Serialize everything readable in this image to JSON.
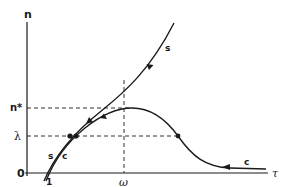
{
  "diagram": {
    "title": "",
    "axes": {
      "y_label": "n",
      "x_label": "τ",
      "origin_label": "0",
      "x_tick_one": "1",
      "x_tick_omega": "ω",
      "y_tick_nstar": "n*",
      "y_tick_lambda": "λ"
    },
    "curves": [
      {
        "id": "s",
        "label": "s",
        "label_lower": "s"
      },
      {
        "id": "c",
        "label": "c",
        "label_lower": "c"
      }
    ],
    "colors": {
      "ink": "#1a1a1a",
      "background": "#ffffff"
    }
  }
}
